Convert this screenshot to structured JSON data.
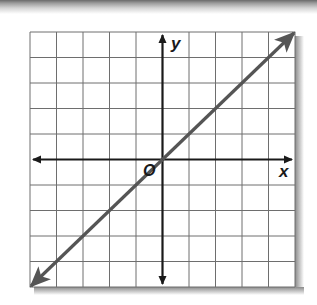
{
  "figure": {
    "type": "coordinate-plane-graph",
    "grid": {
      "columns": 10,
      "rows": 10,
      "x_range": [
        -5,
        5
      ],
      "y_range": [
        -5,
        5
      ]
    },
    "axes": {
      "x_label": "x",
      "y_label": "y",
      "origin_label": "O"
    },
    "line": {
      "equation": "y = x",
      "points": [
        [
          -5,
          -5
        ],
        [
          5,
          5
        ]
      ],
      "arrows_both_ends": true,
      "color": "#555555"
    },
    "colors": {
      "grid": "#6e6e6e",
      "axes": "#1a1a1a",
      "line": "#555555"
    }
  }
}
